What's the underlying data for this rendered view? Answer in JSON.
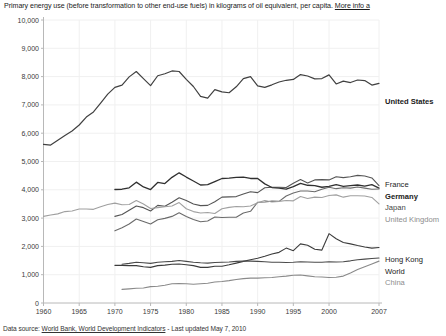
{
  "caption": {
    "text": "Primary energy use (before transformation to other end-use fuels) in kilograms of oil equivalent, per capita.",
    "more_info": "More info a"
  },
  "footer": {
    "prefix": "Data source:",
    "source_link": "World Bank, World Development Indicators",
    "suffix": "- Last updated May 7, 2010"
  },
  "chart_data": {
    "type": "line",
    "title": "Primary energy use (before transformation to other end-use fuels) in kilograms of oil equivalent, per capita.",
    "xlabel": "",
    "ylabel": "",
    "xlim": [
      1960,
      2007
    ],
    "ylim": [
      0,
      10000
    ],
    "grid": true,
    "legend_position": "right",
    "ytick_labels": [
      "0",
      "1,000",
      "2,000",
      "3,000",
      "4,000",
      "5,000",
      "6,000",
      "7,000",
      "8,000",
      "9,000",
      "10,000"
    ],
    "ytick_values": [
      0,
      1000,
      2000,
      3000,
      4000,
      5000,
      6000,
      7000,
      8000,
      9000,
      10000
    ],
    "xtick_labels": [
      "1960",
      "1965",
      "1970",
      "1975",
      "1980",
      "1985",
      "1990",
      "1995",
      "2000",
      "2007"
    ],
    "xtick_values": [
      1960,
      1965,
      1970,
      1975,
      1980,
      1985,
      1990,
      1995,
      2000,
      2007
    ],
    "series": [
      {
        "name": "United States",
        "color": "#404040",
        "width": 1.2,
        "label_color": "dark",
        "label_bold": true,
        "x": [
          1960,
          1961,
          1962,
          1963,
          1964,
          1965,
          1966,
          1967,
          1968,
          1969,
          1970,
          1971,
          1972,
          1973,
          1974,
          1975,
          1976,
          1977,
          1978,
          1979,
          1980,
          1981,
          1982,
          1983,
          1984,
          1985,
          1986,
          1987,
          1988,
          1989,
          1990,
          1991,
          1992,
          1993,
          1994,
          1995,
          1996,
          1997,
          1998,
          1999,
          2000,
          2001,
          2002,
          2003,
          2004,
          2005,
          2006,
          2007
        ],
        "values": [
          5605,
          5580,
          5750,
          5920,
          6080,
          6290,
          6570,
          6750,
          7060,
          7380,
          7620,
          7700,
          7990,
          8180,
          7930,
          7680,
          8030,
          8100,
          8200,
          8180,
          7900,
          7650,
          7300,
          7240,
          7540,
          7460,
          7430,
          7640,
          7930,
          8000,
          7670,
          7620,
          7710,
          7810,
          7870,
          7900,
          8070,
          8020,
          7920,
          7930,
          8060,
          7740,
          7840,
          7790,
          7880,
          7860,
          7700,
          7760
        ]
      },
      {
        "name": "France",
        "color": "#555555",
        "width": 1.1,
        "label_color": "dark",
        "label_bold": false,
        "x": [
          1960,
          1965,
          1970,
          1971,
          1972,
          1973,
          1974,
          1975,
          1976,
          1977,
          1978,
          1979,
          1980,
          1981,
          1982,
          1983,
          1984,
          1985,
          1986,
          1987,
          1988,
          1989,
          1990,
          1991,
          1992,
          1993,
          1994,
          1995,
          1996,
          1997,
          1998,
          1999,
          2000,
          2001,
          2002,
          2003,
          2004,
          2005,
          2006,
          2007
        ],
        "values": [
          null,
          null,
          3060,
          3130,
          3280,
          3430,
          3370,
          3250,
          3450,
          3420,
          3560,
          3720,
          3620,
          3500,
          3440,
          3450,
          3580,
          3740,
          3750,
          3760,
          3850,
          3930,
          3900,
          4070,
          4090,
          4090,
          4080,
          4230,
          4360,
          4240,
          4350,
          4360,
          4350,
          4460,
          4430,
          4460,
          4510,
          4490,
          4420,
          4150
        ]
      },
      {
        "name": "Germany",
        "color": "#303030",
        "width": 1.3,
        "label_color": "dark",
        "label_bold": true,
        "x": [
          1960,
          1965,
          1970,
          1971,
          1972,
          1973,
          1974,
          1975,
          1976,
          1977,
          1978,
          1979,
          1980,
          1981,
          1982,
          1983,
          1984,
          1985,
          1986,
          1987,
          1988,
          1989,
          1990,
          1991,
          1992,
          1993,
          1994,
          1995,
          1996,
          1997,
          1998,
          1999,
          2000,
          2001,
          2002,
          2003,
          2004,
          2005,
          2006,
          2007
        ],
        "values": [
          null,
          null,
          4010,
          4020,
          4070,
          4270,
          4100,
          4010,
          4260,
          4220,
          4440,
          4600,
          4450,
          4310,
          4170,
          4180,
          4290,
          4400,
          4410,
          4440,
          4450,
          4400,
          4400,
          4210,
          4080,
          4060,
          4020,
          4110,
          4230,
          4160,
          4150,
          4090,
          4120,
          4180,
          4120,
          4150,
          4170,
          4130,
          4180,
          4060
        ]
      },
      {
        "name": "Japan",
        "color": "#6b6b6b",
        "width": 1.1,
        "label_color": "mid",
        "label_bold": false,
        "x": [
          1960,
          1965,
          1970,
          1971,
          1972,
          1973,
          1974,
          1975,
          1976,
          1977,
          1978,
          1979,
          1980,
          1981,
          1982,
          1983,
          1984,
          1985,
          1986,
          1987,
          1988,
          1989,
          1990,
          1991,
          1992,
          1993,
          1994,
          1995,
          1996,
          1997,
          1998,
          1999,
          2000,
          2001,
          2002,
          2003,
          2004,
          2005,
          2006,
          2007
        ],
        "values": [
          null,
          null,
          2550,
          2660,
          2790,
          2970,
          2880,
          2790,
          2940,
          2990,
          3060,
          3190,
          3060,
          2950,
          2870,
          2900,
          3040,
          3020,
          3030,
          3030,
          3180,
          3240,
          3560,
          3570,
          3600,
          3590,
          3780,
          3890,
          3960,
          3960,
          3930,
          4020,
          4090,
          4040,
          4070,
          4060,
          4100,
          4060,
          4020,
          4030
        ]
      },
      {
        "name": "United Kingdom",
        "color": "#a0a0a0",
        "width": 1.1,
        "label_color": "grey",
        "label_bold": false,
        "x": [
          1960,
          1961,
          1962,
          1963,
          1964,
          1965,
          1966,
          1967,
          1968,
          1969,
          1970,
          1971,
          1972,
          1973,
          1974,
          1975,
          1976,
          1977,
          1978,
          1979,
          1980,
          1981,
          1982,
          1983,
          1984,
          1985,
          1986,
          1987,
          1988,
          1989,
          1990,
          1991,
          1992,
          1993,
          1994,
          1995,
          1996,
          1997,
          1998,
          1999,
          2000,
          2001,
          2002,
          2003,
          2004,
          2005,
          2006,
          2007
        ],
        "values": [
          3060,
          3110,
          3150,
          3230,
          3250,
          3320,
          3320,
          3310,
          3400,
          3480,
          3530,
          3470,
          3480,
          3620,
          3500,
          3340,
          3370,
          3400,
          3430,
          3550,
          3330,
          3230,
          3180,
          3200,
          3160,
          3330,
          3380,
          3410,
          3400,
          3430,
          3540,
          3620,
          3570,
          3590,
          3620,
          3610,
          3760,
          3690,
          3740,
          3730,
          3800,
          3820,
          3740,
          3790,
          3790,
          3780,
          3730,
          3500
        ]
      },
      {
        "name": "Hong Kong",
        "color": "#3c3c3c",
        "width": 1.1,
        "label_color": "dark",
        "label_bold": false,
        "x": [
          1970,
          1971,
          1972,
          1973,
          1974,
          1975,
          1976,
          1977,
          1978,
          1979,
          1980,
          1981,
          1982,
          1983,
          1984,
          1985,
          1986,
          1987,
          1988,
          1989,
          1990,
          1991,
          1992,
          1993,
          1994,
          1995,
          1996,
          1997,
          1998,
          1999,
          2000,
          2001,
          2002,
          2003,
          2004,
          2005,
          2006,
          2007
        ],
        "values": [
          1330,
          1330,
          1320,
          1320,
          1280,
          1260,
          1320,
          1340,
          1370,
          1380,
          1350,
          1320,
          1260,
          1260,
          1300,
          1300,
          1350,
          1410,
          1470,
          1530,
          1580,
          1650,
          1730,
          1790,
          1940,
          1850,
          2090,
          2040,
          1900,
          1870,
          2450,
          2270,
          2140,
          2090,
          2030,
          1980,
          1940,
          1960
        ]
      },
      {
        "name": "World",
        "color": "#4a4a4a",
        "width": 1.1,
        "label_color": "dark",
        "label_bold": false,
        "x": [
          1971,
          1972,
          1973,
          1974,
          1975,
          1976,
          1977,
          1978,
          1979,
          1980,
          1981,
          1982,
          1983,
          1984,
          1985,
          1986,
          1987,
          1988,
          1989,
          1990,
          1991,
          1992,
          1993,
          1994,
          1995,
          1996,
          1997,
          1998,
          1999,
          2000,
          2001,
          2002,
          2003,
          2004,
          2005,
          2006,
          2007
        ],
        "values": [
          1370,
          1400,
          1440,
          1420,
          1400,
          1440,
          1460,
          1470,
          1500,
          1470,
          1440,
          1420,
          1410,
          1430,
          1440,
          1450,
          1470,
          1480,
          1480,
          1470,
          1460,
          1440,
          1440,
          1430,
          1440,
          1460,
          1450,
          1440,
          1440,
          1460,
          1450,
          1460,
          1490,
          1530,
          1550,
          1570,
          1590
        ]
      },
      {
        "name": "China",
        "color": "#8a8a8a",
        "width": 1.1,
        "label_color": "grey",
        "label_bold": false,
        "x": [
          1971,
          1972,
          1973,
          1974,
          1975,
          1976,
          1977,
          1978,
          1979,
          1980,
          1981,
          1982,
          1983,
          1984,
          1985,
          1986,
          1987,
          1988,
          1989,
          1990,
          1991,
          1992,
          1993,
          1994,
          1995,
          1996,
          1997,
          1998,
          1999,
          2000,
          2001,
          2002,
          2003,
          2004,
          2005,
          2006,
          2007
        ],
        "values": [
          480,
          500,
          520,
          530,
          580,
          590,
          630,
          680,
          690,
          680,
          660,
          680,
          700,
          740,
          760,
          790,
          830,
          860,
          880,
          880,
          890,
          900,
          930,
          950,
          980,
          990,
          960,
          930,
          920,
          900,
          910,
          950,
          1060,
          1180,
          1280,
          1380,
          1480
        ]
      }
    ],
    "legend_groups": [
      {
        "labels": [
          "United States"
        ]
      },
      {
        "labels": [
          "France",
          "Germany",
          "Japan",
          "United Kingdom"
        ]
      },
      {
        "labels": [
          "Hong Kong",
          "World",
          "China"
        ]
      }
    ]
  }
}
